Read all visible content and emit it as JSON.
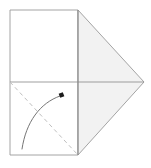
{
  "diagram": {
    "kind": "origami-fold-step",
    "title": "Paper fold diagram",
    "canvas": {
      "width": 151,
      "height": 168
    },
    "colors": {
      "background": "#ffffff",
      "paper_front": "#ffffff",
      "paper_back": "#f2f2f2",
      "edge_stroke": "#9a9a9a",
      "crease_stroke": "#b4b4b4",
      "fold_line_stroke": "#bcbcbc",
      "arrow_stroke": "#6e6e6e",
      "arrow_head_fill": "#1c1c1c"
    },
    "shapes": {
      "left_panel": {
        "name": "white rectangle panel",
        "points": "10,10 78,10 78,155 10,155",
        "fill": "#ffffff"
      },
      "right_triangle": {
        "name": "shaded triangle flap pointing right",
        "points": "78,10 144,82 78,155",
        "fill": "#f2f2f2"
      }
    },
    "lines": {
      "horizontal_crease": {
        "name": "horizontal center crease",
        "x1": 10,
        "y1": 82,
        "x2": 144,
        "y2": 82
      },
      "vertical_crease": {
        "name": "vertical center crease",
        "x1": 78,
        "y1": 10,
        "x2": 78,
        "y2": 155
      },
      "fold_dashed": {
        "name": "dashed valley fold line",
        "x1": 10,
        "y1": 82,
        "x2": 78,
        "y2": 155,
        "dash_pattern": "4,3.2"
      }
    },
    "arrow": {
      "name": "curved fold direction arrow",
      "path": "M 22,149 C 26,122 40,103 60,96",
      "head_x": 61.5,
      "head_y": 95.0,
      "head_size": 4.4,
      "head_rotation": -21
    },
    "labels": {
      "step_caption": "",
      "annotation": ""
    }
  }
}
